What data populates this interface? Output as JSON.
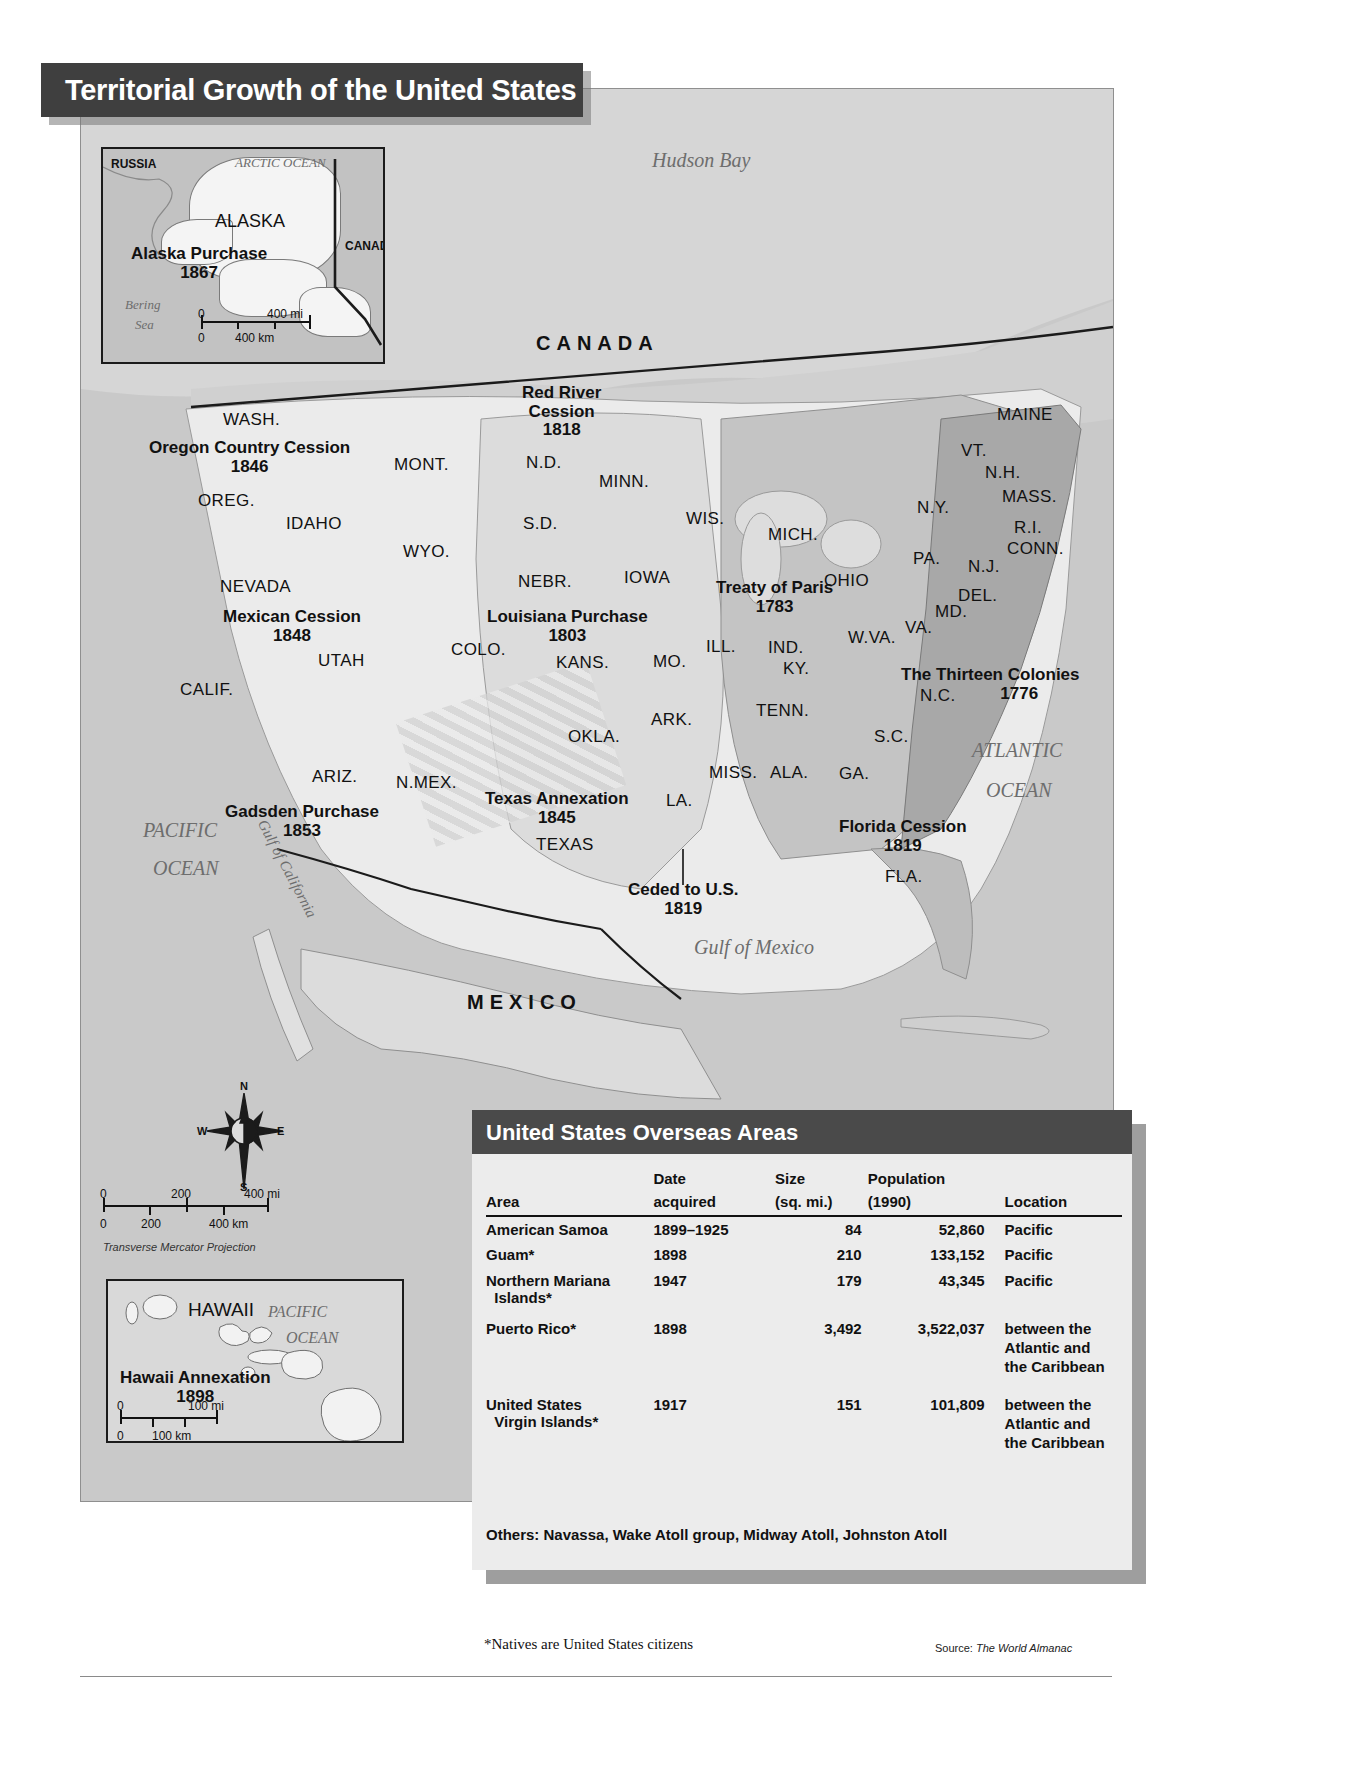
{
  "title": "Territorial Growth of the United States",
  "alaska_inset": {
    "russia": "RUSSIA",
    "arctic_ocean": "ARCTIC OCEAN",
    "alaska": "ALASKA",
    "canada": "CANADA",
    "bering_sea_line1": "Bering",
    "bering_sea_line2": "Sea",
    "annexation_label": "Alaska Purchase",
    "annexation_year": "1867",
    "scale": {
      "mi_zero": "0",
      "mi_max": "400 mi",
      "km_zero": "0",
      "km_max": "400 km"
    }
  },
  "hawaii_inset": {
    "hawaii": "HAWAII",
    "pacific_line1": "PACIFIC",
    "pacific_line2": "OCEAN",
    "annexation_label": "Hawaii Annexation",
    "annexation_year": "1898",
    "scale": {
      "mi_zero": "0",
      "mi_max": "100 mi",
      "km_zero": "0",
      "km_max": "100 km"
    }
  },
  "main_scale": {
    "mi_zero": "0",
    "mi_mid": "200",
    "mi_max": "400 mi",
    "km_zero": "0",
    "km_mid": "200",
    "km_max": "400 km",
    "projection": "Transverse Mercator Projection"
  },
  "compass": {
    "n": "N",
    "s": "S",
    "e": "E",
    "w": "W"
  },
  "countries": [
    {
      "name": "CANADA",
      "x": 455,
      "y": 243
    },
    {
      "name": "MEXICO",
      "x": 386,
      "y": 902
    }
  ],
  "oceans": [
    {
      "name": "Hudson Bay",
      "x": 651,
      "y": 157,
      "size": "lg"
    },
    {
      "name": "ATLANTIC",
      "x": 971,
      "y": 735,
      "size": "lg"
    },
    {
      "name": "OCEAN",
      "x": 985,
      "y": 773,
      "size": "lg"
    },
    {
      "name": "PACIFIC",
      "x": 142,
      "y": 816,
      "size": "lg"
    },
    {
      "name": "OCEAN",
      "x": 152,
      "y": 853,
      "size": "lg"
    },
    {
      "name": "Gulf  of  Mexico",
      "x": 693,
      "y": 932,
      "size": "lg"
    }
  ],
  "gulf_of_california": "Gulf of California",
  "territories": [
    {
      "label": "Oregon Country Cession",
      "year": "1846",
      "x": 148,
      "y": 438
    },
    {
      "label": "Red River",
      "sub": "Cession",
      "year": "1818",
      "x": 521,
      "y": 383
    },
    {
      "label": "Mexican Cession",
      "year": "1848",
      "x": 222,
      "y": 607
    },
    {
      "label": "Louisiana Purchase",
      "year": "1803",
      "x": 486,
      "y": 607
    },
    {
      "label": "Treaty of Paris",
      "year": "1783",
      "x": 715,
      "y": 578
    },
    {
      "label": "The Thirteen Colonies",
      "year": "1776",
      "x": 900,
      "y": 665
    },
    {
      "label": "Gadsden Purchase",
      "year": "1853",
      "x": 224,
      "y": 802
    },
    {
      "label": "Texas Annexation",
      "year": "1845",
      "x": 484,
      "y": 789
    },
    {
      "label": "Florida Cession",
      "year": "1819",
      "x": 838,
      "y": 817
    },
    {
      "label": "Ceded to U.S.",
      "year": "1819",
      "x": 627,
      "y": 880
    },
    {
      "label": "Alaska Purchase",
      "year": "1867",
      "x": 130,
      "y": 246
    },
    {
      "label": "Hawaii Annexation",
      "year": "1898",
      "x": 114,
      "y": 1325
    }
  ],
  "states": [
    {
      "abbr": "WASH.",
      "x": 222,
      "y": 409
    },
    {
      "abbr": "OREG.",
      "x": 197,
      "y": 490
    },
    {
      "abbr": "IDAHO",
      "x": 285,
      "y": 513
    },
    {
      "abbr": "MONT.",
      "x": 393,
      "y": 454
    },
    {
      "abbr": "WYO.",
      "x": 402,
      "y": 541
    },
    {
      "abbr": "NEVADA",
      "x": 219,
      "y": 576
    },
    {
      "abbr": "UTAH",
      "x": 317,
      "y": 650
    },
    {
      "abbr": "CALIF.",
      "x": 179,
      "y": 679
    },
    {
      "abbr": "ARIZ.",
      "x": 311,
      "y": 766
    },
    {
      "abbr": "N.MEX.",
      "x": 395,
      "y": 772
    },
    {
      "abbr": "COLO.",
      "x": 450,
      "y": 639
    },
    {
      "abbr": "N.D.",
      "x": 525,
      "y": 452
    },
    {
      "abbr": "S.D.",
      "x": 522,
      "y": 513
    },
    {
      "abbr": "NEBR.",
      "x": 517,
      "y": 571
    },
    {
      "abbr": "KANS.",
      "x": 555,
      "y": 652
    },
    {
      "abbr": "OKLA.",
      "x": 567,
      "y": 726
    },
    {
      "abbr": "TEXAS",
      "x": 535,
      "y": 834
    },
    {
      "abbr": "MINN.",
      "x": 598,
      "y": 471
    },
    {
      "abbr": "IOWA",
      "x": 623,
      "y": 567
    },
    {
      "abbr": "MO.",
      "x": 652,
      "y": 651
    },
    {
      "abbr": "ARK.",
      "x": 650,
      "y": 709
    },
    {
      "abbr": "LA.",
      "x": 665,
      "y": 790
    },
    {
      "abbr": "WIS.",
      "x": 685,
      "y": 508
    },
    {
      "abbr": "ILL.",
      "x": 705,
      "y": 636
    },
    {
      "abbr": "MICH.",
      "x": 767,
      "y": 524
    },
    {
      "abbr": "IND.",
      "x": 767,
      "y": 637
    },
    {
      "abbr": "KY.",
      "x": 782,
      "y": 658
    },
    {
      "abbr": "TENN.",
      "x": 755,
      "y": 700
    },
    {
      "abbr": "MISS.",
      "x": 708,
      "y": 762
    },
    {
      "abbr": "ALA.",
      "x": 769,
      "y": 762
    },
    {
      "abbr": "GA.",
      "x": 838,
      "y": 763
    },
    {
      "abbr": "FLA.",
      "x": 884,
      "y": 866
    },
    {
      "abbr": "S.C.",
      "x": 873,
      "y": 726
    },
    {
      "abbr": "N.C.",
      "x": 919,
      "y": 685
    },
    {
      "abbr": "VA.",
      "x": 904,
      "y": 617
    },
    {
      "abbr": "W.VA.",
      "x": 847,
      "y": 627
    },
    {
      "abbr": "OHIO",
      "x": 823,
      "y": 570
    },
    {
      "abbr": "PA.",
      "x": 912,
      "y": 548
    },
    {
      "abbr": "N.Y.",
      "x": 916,
      "y": 497
    },
    {
      "abbr": "MD.",
      "x": 934,
      "y": 601
    },
    {
      "abbr": "DEL.",
      "x": 957,
      "y": 585
    },
    {
      "abbr": "N.J.",
      "x": 967,
      "y": 556
    },
    {
      "abbr": "CONN.",
      "x": 1006,
      "y": 538
    },
    {
      "abbr": "R.I.",
      "x": 1013,
      "y": 517
    },
    {
      "abbr": "MASS.",
      "x": 1001,
      "y": 486
    },
    {
      "abbr": "N.H.",
      "x": 984,
      "y": 462
    },
    {
      "abbr": "VT.",
      "x": 960,
      "y": 440
    },
    {
      "abbr": "MAINE",
      "x": 996,
      "y": 404
    }
  ],
  "overseas": {
    "heading": "United States Overseas Areas",
    "columns": [
      {
        "top": "",
        "bottom": "Area"
      },
      {
        "top": "Date",
        "bottom": "acquired"
      },
      {
        "top": "Size",
        "bottom": "(sq. mi.)"
      },
      {
        "top": "Population",
        "bottom": "(1990)"
      },
      {
        "top": "",
        "bottom": "Location"
      }
    ],
    "rows": [
      {
        "area": "American Samoa",
        "date": "1899–1925",
        "size": "84",
        "population": "52,860",
        "location": "Pacific"
      },
      {
        "area": "Guam*",
        "date": "1898",
        "size": "210",
        "population": "133,152",
        "location": "Pacific"
      },
      {
        "area": "Northern Mariana\n  Islands*",
        "date": "1947",
        "size": "179",
        "population": "43,345",
        "location": "Pacific"
      },
      {
        "area": "Puerto Rico*",
        "date": "1898",
        "size": "3,492",
        "population": "3,522,037",
        "location": "between the\nAtlantic and\nthe Caribbean"
      },
      {
        "area": "United States\n  Virgin Islands*",
        "date": "1917",
        "size": "151",
        "population": "101,809",
        "location": "between the\nAtlantic and\nthe Caribbean"
      }
    ],
    "others": "Others: Navassa, Wake Atoll group, Midway Atoll, Johnston Atoll"
  },
  "notes": {
    "natives": "*Natives are United States citizens",
    "source_prefix": "Source: ",
    "source_name": "The World Almanac"
  },
  "colors": {
    "banner": "#3f3f3f",
    "water": "#c9c9c9",
    "land": "#e3e3e3",
    "panel": "#ececec",
    "text": "#111111"
  }
}
